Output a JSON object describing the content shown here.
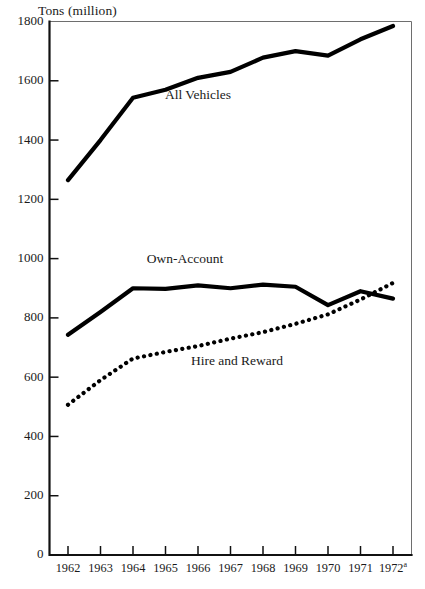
{
  "chart_data": {
    "type": "line",
    "title": "",
    "ylabel": "Tons (million)",
    "xlabel": "",
    "ylim": [
      0,
      1800
    ],
    "yticks": [
      0,
      200,
      400,
      600,
      800,
      1000,
      1200,
      1400,
      1600,
      1800
    ],
    "grid": false,
    "legend_position": "inline-annotations",
    "categories": [
      "1962",
      "1963",
      "1964",
      "1965",
      "1966",
      "1967",
      "1968",
      "1969",
      "1970",
      "1971",
      "1972"
    ],
    "x_tick_labels": [
      "1962",
      "1963",
      "1964",
      "1965",
      "1966",
      "1967",
      "1968",
      "1969",
      "1970",
      "1971",
      "1972"
    ],
    "x_tick_superscripts": [
      "",
      "",
      "",
      "",
      "",
      "",
      "",
      "",
      "",
      "",
      "a"
    ],
    "series": [
      {
        "name": "All Vehicles",
        "style": "solid",
        "values": [
          1265,
          1400,
          1543,
          1570,
          1610,
          1630,
          1678,
          1700,
          1685,
          1740,
          1785
        ]
      },
      {
        "name": "Own-Account",
        "style": "solid",
        "values": [
          743,
          820,
          900,
          898,
          910,
          900,
          912,
          905,
          843,
          890,
          865
        ]
      },
      {
        "name": "Hire and Reward",
        "style": "dotted",
        "values": [
          507,
          590,
          663,
          685,
          705,
          730,
          752,
          780,
          812,
          862,
          918
        ]
      }
    ],
    "annotations": [
      {
        "text": "All Vehicles",
        "series": "All Vehicles",
        "x_value": 1966.0,
        "y_value": 1540
      },
      {
        "text": "Own-Account",
        "series": "Own-Account",
        "x_value": 1965.6,
        "y_value": 985
      },
      {
        "text": "Hire and Reward",
        "series": "Hire and Reward",
        "x_value": 1967.2,
        "y_value": 640
      }
    ],
    "colors": {
      "series_line": "#000000",
      "axis": "#111111",
      "frame": "#6e6e6e",
      "background": "#ffffff",
      "text": "#1a1a1a"
    }
  }
}
